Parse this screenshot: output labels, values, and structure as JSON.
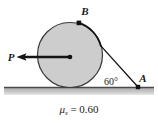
{
  "figure": {
    "background_color": "#ffffff",
    "points": {
      "B": {
        "label": "B",
        "x": 79,
        "y": 23,
        "label_x": 85,
        "label_y": 14
      },
      "A": {
        "label": "A",
        "x": 138,
        "y": 87,
        "label_x": 140,
        "label_y": 81
      }
    },
    "force": {
      "label": "P",
      "label_x": 10,
      "label_y": 60,
      "tail_x": 70,
      "tail_y": 57,
      "head_x": 17,
      "head_y": 57,
      "color": "#1a1a1a"
    },
    "angle": {
      "label": "60°",
      "value": 60,
      "unit": "degrees",
      "label_x": 104,
      "label_y": 84
    },
    "circle": {
      "center_x": 70,
      "center_y": 55,
      "radius": 32.5,
      "fill_color": "#cdcdcd",
      "stroke_color": "#3a3a3a"
    },
    "cord": {
      "tangent_x": 101,
      "tangent_y": 45,
      "end_x": 138,
      "end_y": 87,
      "color": "#1a1a1a"
    },
    "ground": {
      "y": 87.5,
      "x_start": 4,
      "x_end": 154,
      "line_color": "#4a4a4a",
      "hatch_color": "#b9b9b9"
    },
    "caption": {
      "symbol": "μ",
      "subscript": "s",
      "equals": " = ",
      "value": "0.60",
      "full_text": "μs = 0.60",
      "x": 79,
      "y": 112
    }
  }
}
